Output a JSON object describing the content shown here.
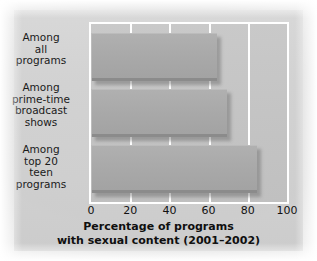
{
  "chart_data": {
    "type": "bar",
    "orientation": "horizontal",
    "title": "",
    "xlabel": "Percentage of programs with sexual content (2001–2002)",
    "xlabel_lines": [
      "Percentage of programs",
      "with sexual content (2001–2002)"
    ],
    "ylabel": "",
    "categories": [
      "Among all programs",
      "Among prime-time broadcast shows",
      "Among top 20 teen programs"
    ],
    "category_lines": [
      [
        "Among",
        "all",
        "programs"
      ],
      [
        "Among",
        "prime-time",
        "broadcast",
        "shows"
      ],
      [
        "Among",
        "top 20",
        "teen",
        "programs"
      ]
    ],
    "values": [
      64,
      69,
      84
    ],
    "xlim": [
      0,
      100
    ],
    "xticks": [
      0,
      20,
      40,
      60,
      80,
      100
    ],
    "xtick_labels": [
      "0",
      "20",
      "40",
      "60",
      "80",
      "100"
    ],
    "grid": true,
    "grid_color": "#ffffff",
    "legend": null,
    "bar_color": "#a9a9a9",
    "plot_background": "#c4c4c4",
    "figure_background": "#d2d2d2"
  }
}
